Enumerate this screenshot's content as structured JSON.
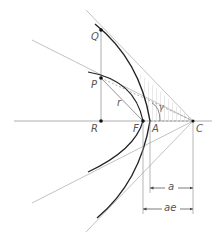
{
  "diagram": {
    "type": "hyperbola geometry",
    "points": {
      "Q": {
        "label": "Q",
        "x": 101,
        "y": 30
      },
      "P": {
        "label": "P",
        "x": 101,
        "y": 78
      },
      "R": {
        "label": "R",
        "x": 101,
        "y": 121
      },
      "F": {
        "label": "F",
        "x": 143,
        "y": 121
      },
      "A": {
        "label": "A",
        "x": 150,
        "y": 121
      },
      "C": {
        "label": "C",
        "x": 193,
        "y": 121
      }
    },
    "labels": {
      "r": "r",
      "gamma": "γ",
      "a": "a",
      "ae": "ae"
    },
    "dimensions": [
      {
        "label": "a",
        "from": "A",
        "to": "C"
      },
      {
        "label": "ae",
        "from": "F",
        "to": "C"
      }
    ],
    "colors": {
      "curve": "#222222",
      "guide": "#bbbbbb",
      "hatch": "#c8c8c8",
      "text": "#555555"
    }
  }
}
